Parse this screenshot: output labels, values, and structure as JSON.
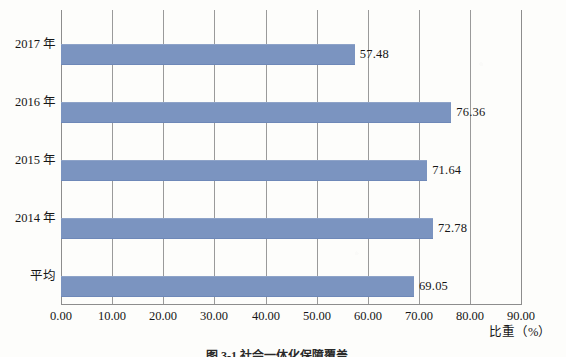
{
  "chart_data": {
    "type": "bar",
    "orientation": "horizontal",
    "title": "",
    "xlabel": "比重（%）",
    "ylabel": "",
    "categories": [
      "2017 年",
      "2016 年",
      "2015 年",
      "2014 年",
      "平均"
    ],
    "values": [
      57.48,
      76.36,
      71.64,
      72.78,
      69.05
    ],
    "value_labels": [
      "57.48",
      "76.36",
      "71.64",
      "72.78",
      "69.05"
    ],
    "series": [
      {
        "name": "比重",
        "values": [
          57.48,
          76.36,
          71.64,
          72.78,
          69.05
        ],
        "color": "#7b94c0"
      }
    ],
    "xlim": [
      0,
      90
    ],
    "xticks": [
      0,
      10,
      20,
      30,
      40,
      50,
      60,
      70,
      80,
      90
    ],
    "xtick_labels": [
      "0.00",
      "10.00",
      "20.00",
      "30.00",
      "40.00",
      "50.00",
      "60.00",
      "70.00",
      "80.00",
      "90.00"
    ],
    "grid": true,
    "grid_axis": "x",
    "legend": false,
    "legend_position": "none",
    "bar_color": "#7b94c0",
    "gridline_color": "#9a9a9a",
    "background_color": "#fdfdfb"
  },
  "caption": {
    "text": "图 3-1  社会一体化保障覆盖…"
  }
}
